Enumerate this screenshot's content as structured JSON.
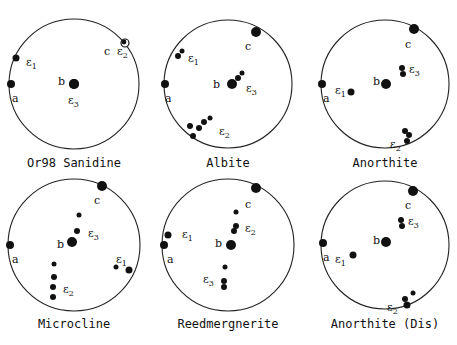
{
  "chart_data": {
    "type": "stereographic-projection",
    "panels": [
      {
        "title": "Or98 Sanidine",
        "center": [
          74,
          84
        ],
        "radius": 65,
        "axes": {
          "a": [
            -64,
            0
          ],
          "b": [
            0,
            0
          ],
          "c": [
            50,
            -40
          ]
        },
        "points": [
          {
            "label": "a",
            "xy": [
              -63,
              0
            ],
            "r": 4
          },
          {
            "label": "b",
            "xy": [
              0,
              0
            ],
            "r": 5
          },
          {
            "label": "c",
            "xy": [
              50,
              -40
            ],
            "r": 0
          },
          {
            "label": "ε1",
            "xy": [
              -58,
              -26
            ],
            "r": 3.5
          },
          {
            "label": "ε2",
            "xy": [
              51,
              -41
            ],
            "r": 4,
            "open": true
          },
          {
            "label": "ε3",
            "xy": [
              0,
              0
            ],
            "r": 5
          }
        ],
        "labels": [
          {
            "text": "ε1",
            "xy": [
              -48,
              -22
            ]
          },
          {
            "text": "c",
            "xy": [
              30,
              -33
            ]
          },
          {
            "text": "ε2",
            "xy": [
              43,
              -33
            ]
          },
          {
            "text": "b",
            "xy": [
              -16,
              -3
            ]
          },
          {
            "text": "a",
            "xy": [
              -62,
              14
            ]
          },
          {
            "text": "ε3",
            "xy": [
              -6,
              16
            ]
          }
        ]
      },
      {
        "title": "Albite",
        "center": [
          228,
          84
        ],
        "radius": 64,
        "points": [
          {
            "label": "a",
            "xy": [
              -63,
              0
            ],
            "r": 4
          },
          {
            "label": "b",
            "xy": [
              4,
              0
            ],
            "r": 5
          },
          {
            "label": "c",
            "xy": [
              28,
              -52
            ],
            "r": 5
          },
          {
            "label": "ε1",
            "xy": [
              -50,
              -28
            ],
            "r": 3
          },
          {
            "label": "ε1",
            "xy": [
              -46,
              -33
            ],
            "r": 2.5
          },
          {
            "label": "ε3",
            "xy": [
              10,
              -6
            ],
            "r": 3
          },
          {
            "label": "ε3",
            "xy": [
              14,
              -11
            ],
            "r": 2.5
          },
          {
            "label": "ε2",
            "xy": [
              -38,
              42
            ],
            "r": 3
          },
          {
            "label": "ε2",
            "xy": [
              -29,
              44
            ],
            "r": 3
          },
          {
            "label": "ε2",
            "xy": [
              -24,
              38
            ],
            "r": 3
          },
          {
            "label": "ε2",
            "xy": [
              -35,
              52
            ],
            "r": 3
          },
          {
            "label": "ε2",
            "xy": [
              -18,
              34
            ],
            "r": 2.5
          }
        ],
        "labels": [
          {
            "text": "c",
            "xy": [
              17,
              -38
            ]
          },
          {
            "text": "ε1",
            "xy": [
              -40,
              -26
            ]
          },
          {
            "text": "b",
            "xy": [
              -15,
              0
            ]
          },
          {
            "text": "ε3",
            "xy": [
              18,
              4
            ]
          },
          {
            "text": "a",
            "xy": [
              -63,
              14
            ]
          },
          {
            "text": "ε2",
            "xy": [
              -9,
              47
            ]
          }
        ]
      },
      {
        "title": "Anorthite",
        "center": [
          385,
          84
        ],
        "radius": 64,
        "points": [
          {
            "label": "a",
            "xy": [
              -63,
              0
            ],
            "r": 4
          },
          {
            "label": "b",
            "xy": [
              1,
              0
            ],
            "r": 5
          },
          {
            "label": "c",
            "xy": [
              29,
              -55
            ],
            "r": 5
          },
          {
            "label": "ε1",
            "xy": [
              -34,
              8
            ],
            "r": 3.5
          },
          {
            "label": "ε3",
            "xy": [
              17,
              -16
            ],
            "r": 3
          },
          {
            "label": "ε3",
            "xy": [
              18,
              -10
            ],
            "r": 3
          },
          {
            "label": "ε2",
            "xy": [
              20,
              47
            ],
            "r": 3
          },
          {
            "label": "ε2",
            "xy": [
              24,
              51
            ],
            "r": 3
          },
          {
            "label": "ε2",
            "xy": [
              22,
              57
            ],
            "r": 3
          }
        ],
        "labels": [
          {
            "text": "c",
            "xy": [
              20,
              -40
            ]
          },
          {
            "text": "ε3",
            "xy": [
              24,
              -15
            ]
          },
          {
            "text": "b",
            "xy": [
              -12,
              -3
            ]
          },
          {
            "text": "ε1",
            "xy": [
              -50,
              6
            ]
          },
          {
            "text": "a",
            "xy": [
              -62,
              14
            ]
          },
          {
            "text": "ε2",
            "xy": [
              5,
              60
            ]
          }
        ]
      },
      {
        "title": "Microcline",
        "center": [
          74,
          245
        ],
        "radius": 66,
        "points": [
          {
            "label": "a",
            "xy": [
              -64,
              0
            ],
            "r": 4
          },
          {
            "label": "b",
            "xy": [
              -2,
              -3
            ],
            "r": 5
          },
          {
            "label": "c",
            "xy": [
              28,
              -59
            ],
            "r": 5
          },
          {
            "label": "ε3",
            "xy": [
              5,
              -30
            ],
            "r": 2.5
          },
          {
            "label": "ε3",
            "xy": [
              3,
              -14
            ],
            "r": 3
          },
          {
            "label": "ε1",
            "xy": [
              42,
              22
            ],
            "r": 2.5
          },
          {
            "label": "ε1",
            "xy": [
              55,
              25
            ],
            "r": 3.5
          },
          {
            "label": "ε2",
            "xy": [
              -20,
              19
            ],
            "r": 2.5
          },
          {
            "label": "ε2",
            "xy": [
              -20,
              32
            ],
            "r": 3
          },
          {
            "label": "ε2",
            "xy": [
              -21,
              42
            ],
            "r": 3
          },
          {
            "label": "ε2",
            "xy": [
              -21,
              52
            ],
            "r": 3
          }
        ],
        "labels": [
          {
            "text": "c",
            "xy": [
              20,
              -45
            ]
          },
          {
            "text": "ε3",
            "xy": [
              14,
              -12
            ]
          },
          {
            "text": "b",
            "xy": [
              -17,
              -1
            ]
          },
          {
            "text": "a",
            "xy": [
              -62,
              14
            ]
          },
          {
            "text": "ε1",
            "xy": [
              42,
              14
            ]
          },
          {
            "text": "ε2",
            "xy": [
              -11,
              44
            ]
          }
        ]
      },
      {
        "title": "Reedmergnerite",
        "center": [
          228,
          245
        ],
        "radius": 66,
        "points": [
          {
            "label": "a",
            "xy": [
              -64,
              0
            ],
            "r": 4
          },
          {
            "label": "b",
            "xy": [
              3,
              0
            ],
            "r": 5
          },
          {
            "label": "c",
            "xy": [
              28,
              -57
            ],
            "r": 5
          },
          {
            "label": "ε1",
            "xy": [
              -60,
              -10
            ],
            "r": 3.5
          },
          {
            "label": "ε2",
            "xy": [
              8,
              -33
            ],
            "r": 2.5
          },
          {
            "label": "ε2",
            "xy": [
              8,
              -19
            ],
            "r": 3
          },
          {
            "label": "ε2",
            "xy": [
              6,
              -14
            ],
            "r": 3
          },
          {
            "label": "ε3",
            "xy": [
              -3,
              22
            ],
            "r": 2.5
          },
          {
            "label": "ε3",
            "xy": [
              -4,
              36
            ],
            "r": 3
          },
          {
            "label": "ε3",
            "xy": [
              -4,
              42
            ],
            "r": 3
          }
        ],
        "labels": [
          {
            "text": "c",
            "xy": [
              17,
              -41
            ]
          },
          {
            "text": "ε2",
            "xy": [
              17,
              -17
            ]
          },
          {
            "text": "ε1",
            "xy": [
              -46,
              -11
            ]
          },
          {
            "text": "b",
            "xy": [
              -13,
              -2
            ]
          },
          {
            "text": "a",
            "xy": [
              -61,
              14
            ]
          },
          {
            "text": "ε3",
            "xy": [
              -25,
              34
            ]
          }
        ]
      },
      {
        "title": "Anorthite (Dis)",
        "center": [
          385,
          245
        ],
        "radius": 64,
        "points": [
          {
            "label": "a",
            "xy": [
              -62,
              -2
            ],
            "r": 4
          },
          {
            "label": "b",
            "xy": [
              1,
              -3
            ],
            "r": 5
          },
          {
            "label": "c",
            "xy": [
              28,
              -54
            ],
            "r": 5
          },
          {
            "label": "ε1",
            "xy": [
              -32,
              10
            ],
            "r": 3.5
          },
          {
            "label": "ε3",
            "xy": [
              16,
              -25
            ],
            "r": 3
          },
          {
            "label": "ε3",
            "xy": [
              17,
              -19
            ],
            "r": 3
          },
          {
            "label": "ε2",
            "xy": [
              28,
              48
            ],
            "r": 2.5
          },
          {
            "label": "ε2",
            "xy": [
              20,
              54
            ],
            "r": 3
          },
          {
            "label": "ε2",
            "xy": [
              22,
              60
            ],
            "r": 3.5
          }
        ],
        "labels": [
          {
            "text": "c",
            "xy": [
              20,
              -40
            ]
          },
          {
            "text": "ε3",
            "xy": [
              23,
              -24
            ]
          },
          {
            "text": "b",
            "xy": [
              -12,
              -5
            ]
          },
          {
            "text": "a",
            "xy": [
              -62,
              12
            ]
          },
          {
            "text": "ε1",
            "xy": [
              -50,
              14
            ]
          },
          {
            "text": "ε2",
            "xy": [
              2,
              62
            ]
          }
        ]
      }
    ]
  },
  "captions": {
    "p0": "Or98 Sanidine",
    "p1": "Albite",
    "p2": "Anorthite",
    "p3": "Microcline",
    "p4": "Reedmergnerite",
    "p5": "Anorthite (Dis)"
  }
}
